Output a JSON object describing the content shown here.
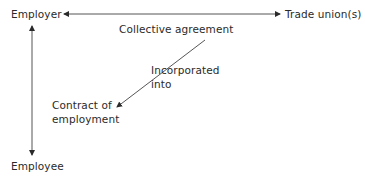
{
  "diagram": {
    "nodes": {
      "employer": "Employer",
      "trade_unions": "Trade union(s)",
      "collective_agreement": "Collective agreement",
      "contract_line1": "Contract of",
      "contract_line2": "employment",
      "employee": "Employee"
    },
    "edge_labels": {
      "incorporated_line1": "Incorporated",
      "incorporated_line2": "into"
    },
    "edges": [
      {
        "from": "employer",
        "to": "trade_unions",
        "type": "bidirectional"
      },
      {
        "from": "employer",
        "to": "employee",
        "type": "bidirectional"
      },
      {
        "from": "collective_agreement",
        "to": "contract_of_employment",
        "type": "directed",
        "label": "Incorporated into"
      }
    ],
    "line_color": "#2a2a2a"
  }
}
